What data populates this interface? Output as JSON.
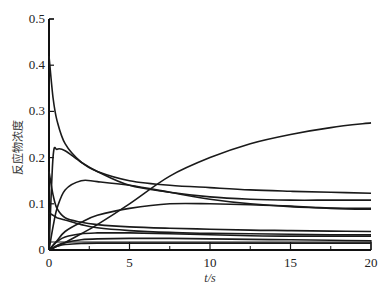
{
  "chart_data": {
    "type": "line",
    "title": "",
    "xlabel": "t/s",
    "ylabel": "反应物浓度",
    "xlim": [
      0,
      20
    ],
    "ylim": [
      0,
      0.5
    ],
    "xticks": [
      "0",
      "5",
      "10",
      "15",
      "20"
    ],
    "yticks": [
      "0",
      "0.1",
      "0.2",
      "0.3",
      "0.4",
      "0.5"
    ],
    "grid": false,
    "legend": null,
    "x": [
      0,
      0.25,
      0.5,
      1,
      2,
      3,
      5,
      7.5,
      10,
      12.5,
      15,
      17.5,
      20
    ],
    "series": [
      {
        "name": "decay-from-0.42",
        "values": [
          0.42,
          0.33,
          0.28,
          0.23,
          0.19,
          0.17,
          0.15,
          0.14,
          0.135,
          0.13,
          0.127,
          0.125,
          0.123
        ]
      },
      {
        "name": "peak-0.22",
        "values": [
          0.0,
          0.2,
          0.218,
          0.215,
          0.19,
          0.17,
          0.14,
          0.125,
          0.115,
          0.11,
          0.108,
          0.108,
          0.108
        ]
      },
      {
        "name": "rising-to-0.28",
        "values": [
          0.0,
          0.004,
          0.008,
          0.016,
          0.035,
          0.055,
          0.1,
          0.16,
          0.2,
          0.23,
          0.25,
          0.265,
          0.275
        ]
      },
      {
        "name": "peak-0.15",
        "values": [
          0.0,
          0.05,
          0.09,
          0.13,
          0.15,
          0.148,
          0.14,
          0.125,
          0.11,
          0.1,
          0.094,
          0.091,
          0.09
        ]
      },
      {
        "name": "rising-to-0.09",
        "values": [
          0.0,
          0.01,
          0.02,
          0.04,
          0.06,
          0.075,
          0.09,
          0.1,
          0.1,
          0.098,
          0.095,
          0.09,
          0.088
        ]
      },
      {
        "name": "fast-decay-to-0.04",
        "values": [
          0.17,
          0.12,
          0.09,
          0.07,
          0.06,
          0.055,
          0.05,
          0.047,
          0.045,
          0.043,
          0.042,
          0.041,
          0.04
        ]
      },
      {
        "name": "decay-0.08",
        "values": [
          0.08,
          0.075,
          0.07,
          0.065,
          0.055,
          0.048,
          0.042,
          0.038,
          0.036,
          0.035,
          0.034,
          0.033,
          0.033
        ]
      },
      {
        "name": "rise-to-0.035",
        "values": [
          0.0,
          0.01,
          0.018,
          0.028,
          0.035,
          0.037,
          0.037,
          0.035,
          0.033,
          0.031,
          0.03,
          0.03,
          0.03
        ]
      },
      {
        "name": "rise-to-0.025",
        "values": [
          0.0,
          0.005,
          0.01,
          0.016,
          0.022,
          0.024,
          0.025,
          0.025,
          0.024,
          0.023,
          0.022,
          0.021,
          0.02
        ]
      },
      {
        "name": "flat-0.015",
        "values": [
          0.0,
          0.004,
          0.008,
          0.012,
          0.014,
          0.015,
          0.015,
          0.015,
          0.015,
          0.015,
          0.015,
          0.015,
          0.015
        ]
      }
    ]
  },
  "axes": {
    "xlabel": "t/s",
    "ylabel": "反应物浓度",
    "xticks": [
      "0",
      "5",
      "10",
      "15",
      "20"
    ],
    "yticks": [
      "0",
      "0.1",
      "0.2",
      "0.3",
      "0.4",
      "0.5"
    ]
  }
}
